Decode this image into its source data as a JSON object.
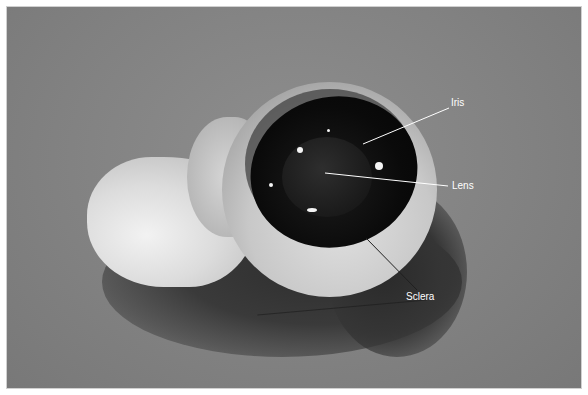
{
  "image": {
    "description": "Grayscale photograph of a dissected eyeball specimen on a gray surface with labeled structures",
    "labels": [
      {
        "text": "Iris",
        "x": 451,
        "y": 103
      },
      {
        "text": "Lens",
        "x": 452,
        "y": 182
      },
      {
        "text": "Sclera",
        "x": 406,
        "y": 292
      }
    ],
    "colors": {
      "background": "#828282",
      "label_text": "#ffffff",
      "leader_line_light": "#ffffff",
      "leader_line_dark": "#202020"
    }
  }
}
